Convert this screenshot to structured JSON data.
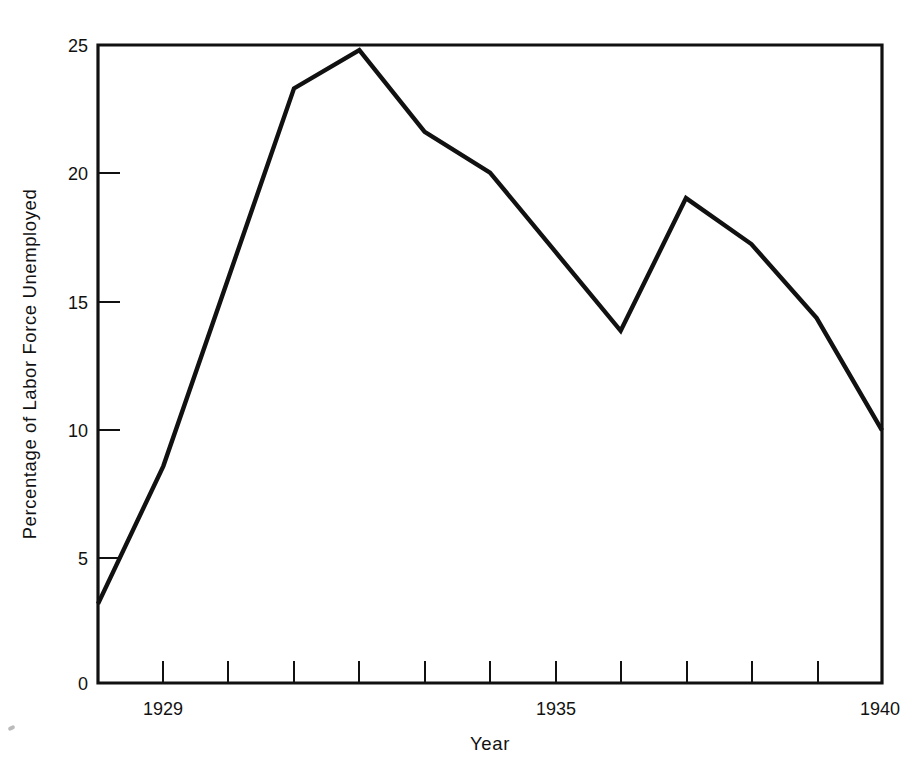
{
  "chart_data": {
    "type": "line",
    "title": "",
    "xlabel": "Year",
    "ylabel": "Percentage of Labor Force Unemployed",
    "xlim": [
      1928,
      1940
    ],
    "ylim": [
      0,
      25
    ],
    "grid": false,
    "legend": "none",
    "x": [
      1928,
      1929,
      1930,
      1931,
      1932,
      1933,
      1934,
      1935,
      1936,
      1937,
      1938,
      1939,
      1940
    ],
    "values": [
      3.1,
      8.5,
      15.9,
      23.3,
      24.8,
      21.6,
      20.0,
      16.9,
      13.8,
      19.0,
      17.2,
      14.3,
      9.9
    ],
    "series": [
      {
        "name": "Percentage of Labor Force Unemployed",
        "values": [
          3.1,
          8.5,
          15.9,
          23.3,
          24.8,
          21.6,
          20.0,
          16.9,
          13.8,
          19.0,
          17.2,
          14.3,
          9.9
        ]
      }
    ],
    "x_tick_values": [
      1928,
      1929,
      1930,
      1931,
      1932,
      1933,
      1934,
      1935,
      1936,
      1937,
      1938,
      1939,
      1940
    ],
    "x_tick_labels": [
      "",
      "1929",
      "",
      "",
      "",
      "",
      "",
      "1935",
      "",
      "",
      "",
      "",
      "1940"
    ],
    "y_tick_values": [
      0,
      5,
      10,
      15,
      20,
      25
    ],
    "y_tick_labels": [
      "0",
      "5",
      "10",
      "15",
      "20",
      "25"
    ],
    "line_color": "#111111",
    "background_color": "#ffffff"
  },
  "axes": {
    "y_labels": {
      "t0": "0",
      "t5": "5",
      "t10": "10",
      "t15": "15",
      "t20": "20",
      "t25": "25"
    },
    "x_labels": {
      "first": "1929",
      "middle": "1935",
      "last": "1940"
    },
    "x_title": "Year",
    "y_title": "Percentage of Labor Force Unemployed"
  }
}
